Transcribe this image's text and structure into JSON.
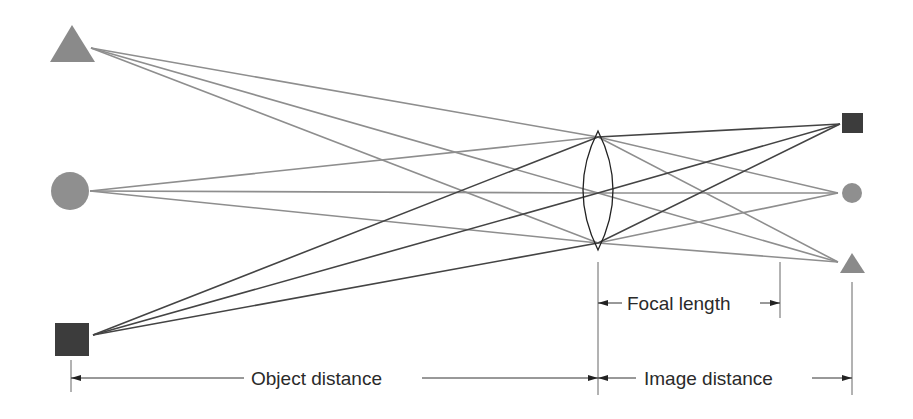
{
  "diagram": {
    "colors": {
      "triangle": "#8a8a8a",
      "circle": "#8f8f8f",
      "square": "#3c3c3c",
      "ray_light": "#8e8e8e",
      "ray_dark": "#444444",
      "lens": "#222222",
      "dimension": "#555555"
    },
    "objects": [
      {
        "shape": "triangle",
        "label": "object-triangle"
      },
      {
        "shape": "circle",
        "label": "object-circle"
      },
      {
        "shape": "square",
        "label": "object-square"
      }
    ],
    "images": [
      {
        "shape": "square",
        "label": "image-square"
      },
      {
        "shape": "circle",
        "label": "image-circle"
      },
      {
        "shape": "triangle",
        "label": "image-triangle"
      }
    ],
    "labels": {
      "focal_length": "Focal length",
      "object_distance": "Object distance",
      "image_distance": "Image distance"
    }
  }
}
